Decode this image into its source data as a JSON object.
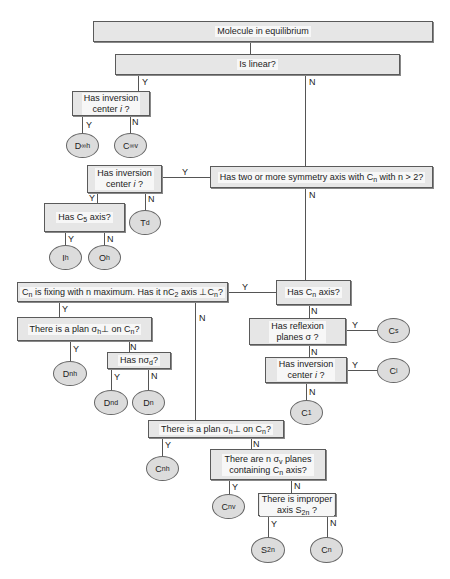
{
  "boxes": {
    "root": "Molecule in equilibrium",
    "is_linear": "Is linear?",
    "linear_inversion": "Has inversion center i ?",
    "two_or_more_axes": "Has two or more symmetry axis with Cn with n > 2?",
    "cubic_inversion": "Has inversion center i ?",
    "has_c5": "Has C5 axis?",
    "cn_fixing": "Cn is fixing with n maximum. Has it nC2 axis ⊥ Cn?",
    "has_cn_axis": "Has Cn axis?",
    "has_reflexion": "Has reflexion planes σ ?",
    "low_inversion": "Has inversion center i ?",
    "plan_sigma_h_d": "There is a plan σh⊥ on Cn?",
    "has_n_sigma_d": "Has nσd?",
    "plan_sigma_h_c": "There is a plan σh⊥ on Cn?",
    "n_sigma_v": "There are n σv planes containing Cn axis?",
    "improper_axis": "There is improper axis S2n ?"
  },
  "groups": {
    "d_inf_h": "D∞h",
    "c_inf_v": "C∞v",
    "td": "Td",
    "ih": "Ih",
    "oh": "Oh",
    "cs": "Cs",
    "ci": "Ci",
    "c1": "C1",
    "dnh": "Dnh",
    "dnd": "Dnd",
    "dn": "Dn",
    "cnh": "Cnh",
    "cnv": "Cnv",
    "s2n": "S2n",
    "cn": "Cn"
  },
  "labels": {
    "yes": "Y",
    "no": "N"
  },
  "colors": {
    "box_fill": "#e6e6e6",
    "ellipse_fill": "#dcdcdc",
    "border": "#5a5a5a"
  }
}
